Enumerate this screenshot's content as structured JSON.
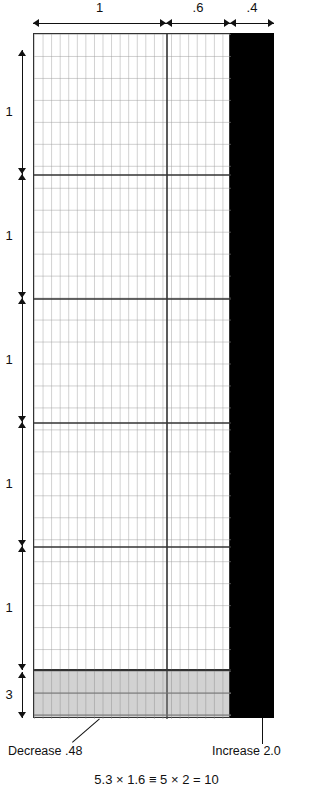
{
  "figure": {
    "title_formula": "5.3 × 1.6 ≡ 5 × 2 = 10",
    "top_dimensions": [
      {
        "label": "1",
        "x": 33,
        "width": 133
      },
      {
        "label": ".6",
        "x": 166,
        "width": 64
      },
      {
        "label": ".4",
        "x": 230,
        "width": 44
      }
    ],
    "side_dimensions": [
      {
        "label": "1",
        "y": 50,
        "height": 124
      },
      {
        "label": "1",
        "y": 174,
        "height": 124
      },
      {
        "label": "1",
        "y": 298,
        "height": 124
      },
      {
        "label": "1",
        "y": 422,
        "height": 124
      },
      {
        "label": "1",
        "y": 546,
        "height": 124
      },
      {
        "label": "3",
        "y": 670,
        "height": 50
      }
    ],
    "callouts": [
      {
        "name": "decrease",
        "text": "Decrease .48",
        "x": 8,
        "y": 745
      },
      {
        "name": "increase",
        "text": "Increase 2.0",
        "x": 215,
        "y": 745
      }
    ],
    "grid": {
      "columns": 23,
      "rows": 29,
      "major_every_x": 10,
      "major_every_y": 5
    },
    "colors": {
      "grid_line": "#9a9a9a",
      "major_line": "#333333",
      "black_bar": "#000000",
      "bottom_strip": "#d2d2d2",
      "text": "#111111"
    }
  }
}
